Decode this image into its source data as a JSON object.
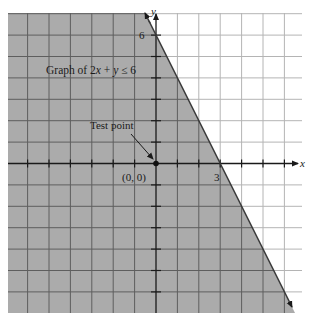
{
  "chart_data": {
    "type": "inequality-region",
    "title": "Graph of 2x + y ≤ 6",
    "inequality": "2x + y ≤ 6",
    "boundary_line": {
      "equation": "2x + y = 6",
      "style": "solid",
      "intercepts": {
        "x": 3,
        "y": 6
      }
    },
    "shaded_side": "below-left (contains origin)",
    "test_point": {
      "label": "Test point",
      "coords": [
        0,
        0
      ],
      "coords_label": "(0, 0)"
    },
    "axes": {
      "xlabel": "x",
      "ylabel": "y",
      "labeled_ticks": {
        "x": [
          "3"
        ],
        "y": [
          "6"
        ]
      }
    },
    "grid": true,
    "xlim": [
      -7,
      6.8
    ],
    "ylim": [
      -7,
      7
    ]
  },
  "labels": {
    "title_prefix": "Graph of 2",
    "title_x": "x",
    "title_mid": " + ",
    "title_y": "y",
    "title_suffix": " ≤ 6",
    "test_point": "Test point",
    "origin": "(0, 0)",
    "x_intercept": "3",
    "y_intercept": "6",
    "x_axis": "x",
    "y_axis": "y"
  },
  "colors": {
    "shade": "#ababab",
    "shade_grid": "#5e5e5e",
    "plain_grid": "#b4b4b4",
    "axis": "#1a1a1a",
    "line": "#3a3a3a"
  }
}
